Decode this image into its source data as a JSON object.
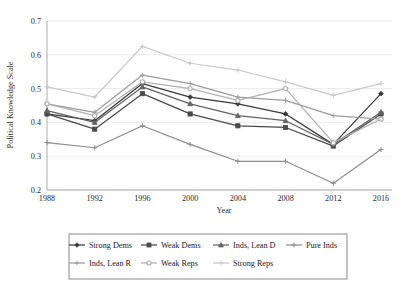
{
  "chart_data": {
    "type": "line",
    "title": "",
    "xlabel": "Year",
    "ylabel": "Political Knowledge Scale",
    "x": [
      1988,
      1992,
      1996,
      2000,
      2004,
      2008,
      2012,
      2016
    ],
    "categories": [
      "1988",
      "1992",
      "1996",
      "2000",
      "2004",
      "2008",
      "2012",
      "2016"
    ],
    "xlim": [
      1988,
      2016
    ],
    "ylim": [
      0.2,
      0.7
    ],
    "yticks": [
      0.2,
      0.3,
      0.4,
      0.5,
      0.6,
      0.7
    ],
    "yticklabels": [
      "0.2",
      "0.3",
      "0.4",
      "0.5",
      "0.6",
      "0.7"
    ],
    "grid": "horizontal",
    "legend_position": "below-plot",
    "series": [
      {
        "name": "Strong Dems",
        "marker": "diamond",
        "color": "#3a3a3a",
        "values": [
          0.425,
          0.405,
          0.515,
          0.475,
          0.455,
          0.425,
          0.335,
          0.485
        ]
      },
      {
        "name": "Weak Dems",
        "marker": "square",
        "color": "#4a4a4a",
        "values": [
          0.425,
          0.38,
          0.485,
          0.425,
          0.39,
          0.385,
          0.33,
          0.425
        ]
      },
      {
        "name": "Inds, Lean D",
        "marker": "triangle",
        "color": "#636363",
        "values": [
          0.435,
          0.4,
          0.505,
          0.455,
          0.42,
          0.405,
          0.335,
          0.43
        ]
      },
      {
        "name": "Pure Inds",
        "marker": "cross",
        "color": "#8d8d8d",
        "values": [
          0.34,
          0.325,
          0.39,
          0.335,
          0.285,
          0.285,
          0.22,
          0.32
        ]
      },
      {
        "name": "Inds, Lean R",
        "marker": "asterisk",
        "color": "#9c9c9c",
        "values": [
          0.455,
          0.43,
          0.54,
          0.515,
          0.475,
          0.465,
          0.42,
          0.41
        ]
      },
      {
        "name": "Weak Reps",
        "marker": "circle",
        "color": "#b0b0b0",
        "values": [
          0.455,
          0.42,
          0.52,
          0.5,
          0.465,
          0.5,
          0.34,
          0.41
        ]
      },
      {
        "name": "Strong Reps",
        "marker": "plus",
        "color": "#c9c9c9",
        "values": [
          0.505,
          0.475,
          0.625,
          0.575,
          0.555,
          0.52,
          0.48,
          0.515
        ]
      }
    ]
  },
  "legend": {
    "row1": [
      "Strong Dems",
      "Weak Dems",
      "Inds, Lean D",
      "Pure Inds"
    ],
    "row2": [
      "Inds, Lean R",
      "Weak Reps",
      "Strong Reps"
    ]
  }
}
